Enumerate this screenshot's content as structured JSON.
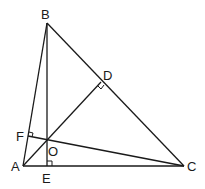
{
  "diagram": {
    "type": "geometry-triangle-orthocenter",
    "points": {
      "A": {
        "label": "A",
        "x": 23,
        "y": 166
      },
      "B": {
        "label": "B",
        "x": 47,
        "y": 23
      },
      "C": {
        "label": "C",
        "x": 184,
        "y": 166
      },
      "D": {
        "label": "D",
        "x": 101,
        "y": 82
      },
      "E": {
        "label": "E",
        "x": 47,
        "y": 166
      },
      "F": {
        "label": "F",
        "x": 28,
        "y": 136
      },
      "O": {
        "label": "O",
        "x": 47,
        "y": 141
      }
    },
    "segments": [
      "AB",
      "BC",
      "CA",
      "BE",
      "AD",
      "CF"
    ],
    "right_angle_marks": [
      "D",
      "E",
      "F"
    ],
    "stroke_color": "#1a1a1a"
  }
}
